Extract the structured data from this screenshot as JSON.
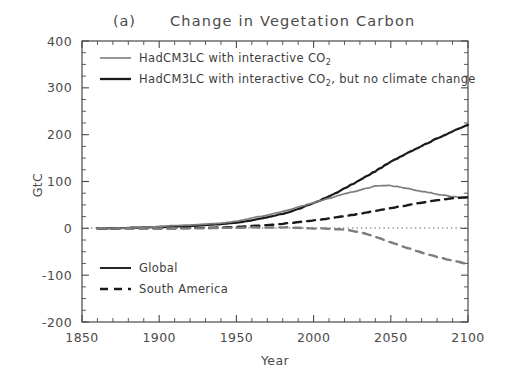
{
  "figure": {
    "panel_tag": "(a)",
    "title": "Change in Vegetation Carbon",
    "background_color": "#ffffff",
    "axis_color": "#4a4a4a"
  },
  "axes": {
    "x": {
      "label": "Year",
      "min": 1850,
      "max": 2100,
      "ticks": [
        "1850",
        "1900",
        "1950",
        "2000",
        "2050",
        "2100"
      ],
      "tick_values": [
        1850,
        1900,
        1950,
        2000,
        2050,
        2100
      ],
      "minor_tick_step": 10
    },
    "y": {
      "label": "GtC",
      "min": -200,
      "max": 400,
      "ticks": [
        "400",
        "300",
        "200",
        "100",
        "0",
        "-100",
        "-200"
      ],
      "tick_values": [
        400,
        300,
        200,
        100,
        0,
        -100,
        -200
      ],
      "minor_tick_step": 25
    }
  },
  "legend_top": {
    "position": "upper-left-inside",
    "items": [
      {
        "label_part1": "HadCM3LC with interactive CO",
        "label_sub": "2",
        "label_part2": "",
        "label": "HadCM3LC with interactive CO2",
        "color": "#7d7d7d",
        "dash": "solid",
        "swatch_name": "legend-swatch-interactive-co2"
      },
      {
        "label_part1": "HadCM3LC with interactive CO",
        "label_sub": "2",
        "label_part2": ", but no climate change",
        "label": "HadCM3LC with interactive CO2, but no climate change",
        "color": "#1a1a1a",
        "dash": "solid",
        "swatch_name": "legend-swatch-no-climate-change"
      }
    ]
  },
  "legend_bottom": {
    "position": "lower-left-inside",
    "items": [
      {
        "label": "Global",
        "color": "#1a1a1a",
        "dash": "solid",
        "swatch_name": "legend-swatch-global"
      },
      {
        "label": "South America",
        "color": "#1a1a1a",
        "dash": "dashed",
        "swatch_name": "legend-swatch-south-america"
      }
    ]
  },
  "chart_data": {
    "type": "line",
    "title": "(a)    Change in Vegetation Carbon",
    "xlabel": "Year",
    "ylabel": "GtC",
    "xlim": [
      1850,
      2100
    ],
    "ylim": [
      -200,
      400
    ],
    "grid": false,
    "zero_line": {
      "value": 0,
      "style": "dotted",
      "color": "#555555"
    },
    "legend_position": "inside upper-left and inside lower-left",
    "x": [
      1860,
      1870,
      1880,
      1890,
      1900,
      1910,
      1920,
      1930,
      1940,
      1950,
      1960,
      1970,
      1980,
      1990,
      2000,
      2010,
      2020,
      2030,
      2040,
      2050,
      2060,
      2070,
      2080,
      2090,
      2100
    ],
    "series": [
      {
        "name": "Global, HadCM3LC with interactive CO2, but no climate change",
        "color": "#1a1a1a",
        "dash": "solid",
        "region": "Global",
        "experiment": "interactive CO2, no climate change",
        "values": [
          0,
          0,
          1,
          2,
          3,
          4,
          5,
          7,
          9,
          12,
          17,
          23,
          31,
          41,
          54,
          68,
          85,
          103,
          122,
          142,
          160,
          176,
          192,
          207,
          221
        ]
      },
      {
        "name": "Global, HadCM3LC with interactive CO2",
        "color": "#7d7d7d",
        "dash": "solid",
        "region": "Global",
        "experiment": "interactive CO2",
        "values": [
          0,
          0,
          1,
          2,
          4,
          6,
          7,
          9,
          11,
          15,
          22,
          28,
          36,
          45,
          55,
          64,
          73,
          82,
          90,
          91,
          86,
          79,
          73,
          68,
          64
        ]
      },
      {
        "name": "South America, HadCM3LC with interactive CO2, but no climate change",
        "color": "#1a1a1a",
        "dash": "dashed",
        "region": "South America",
        "experiment": "interactive CO2, no climate change",
        "values": [
          0,
          0,
          0,
          0,
          0,
          0,
          1,
          1,
          2,
          3,
          5,
          7,
          10,
          13,
          17,
          21,
          26,
          31,
          37,
          43,
          49,
          55,
          60,
          64,
          67
        ]
      },
      {
        "name": "South America, HadCM3LC with interactive CO2",
        "color": "#7d7d7d",
        "dash": "dashed",
        "region": "South America",
        "experiment": "interactive CO2",
        "values": [
          0,
          0,
          0,
          0,
          0,
          0,
          0,
          0,
          1,
          1,
          2,
          2,
          2,
          1,
          0,
          -1,
          -3,
          -8,
          -18,
          -30,
          -41,
          -52,
          -61,
          -69,
          -76
        ]
      }
    ]
  }
}
